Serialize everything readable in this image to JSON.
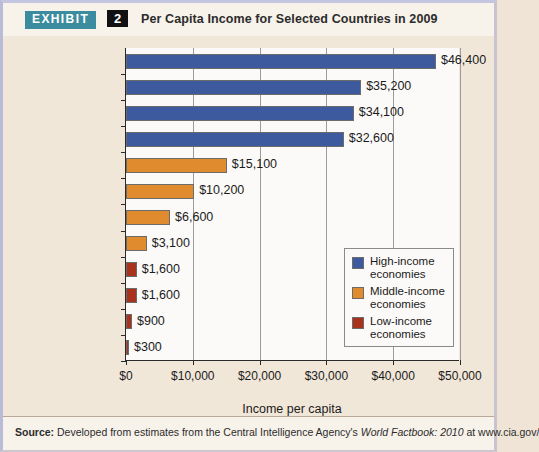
{
  "header": {
    "badge": "EXHIBIT",
    "number": "2",
    "title": "Per Capita Income for Selected Countries in 2009"
  },
  "footer": {
    "source_label": "Source:",
    "source_text_1": "Developed from estimates from the Central Intelligence Agency's",
    "source_italic": "World Factbook: 2010",
    "source_text_2": "at www.cia.gov/"
  },
  "legend": {
    "items": [
      {
        "label_line1": "High-income",
        "label_line2": "economies",
        "color": "#3d5a9e"
      },
      {
        "label_line1": "Middle-income",
        "label_line2": "economies",
        "color": "#e08b2e"
      },
      {
        "label_line1": "Low-income",
        "label_line2": "economies",
        "color": "#a8321c"
      }
    ]
  },
  "chart_data": {
    "type": "bar",
    "orientation": "horizontal",
    "title": "Per Capita Income for Selected Countries in 2009",
    "xlabel": "Income per capita",
    "ylabel": "",
    "xlim": [
      0,
      50000
    ],
    "xticks": [
      0,
      10000,
      20000,
      30000,
      40000,
      50000
    ],
    "xtick_labels": [
      "$0",
      "$10,000",
      "$20,000",
      "$30,000",
      "$40,000",
      "$50,000"
    ],
    "grid": true,
    "legend_position": "inside-right",
    "categories": [
      "United States",
      "United Kingdom",
      "Germany",
      "Japan",
      "Russia",
      "Brazil",
      "China",
      "India",
      "Bangladesh",
      "Kenya",
      "Ethiopia",
      "Congo"
    ],
    "values": [
      46400,
      35200,
      34100,
      32600,
      15100,
      10200,
      6600,
      3100,
      1600,
      1600,
      900,
      300
    ],
    "value_labels": [
      "$46,400",
      "$35,200",
      "$34,100",
      "$32,600",
      "$15,100",
      "$10,200",
      "$6,600",
      "$3,100",
      "$1,600",
      "$1,600",
      "$900",
      "$300"
    ],
    "groups": [
      "high",
      "high",
      "high",
      "high",
      "middle",
      "middle",
      "middle",
      "middle",
      "low",
      "low",
      "low",
      "low"
    ],
    "group_colors": {
      "high": "#3d5a9e",
      "middle": "#e08b2e",
      "low": "#a8321c"
    },
    "series": [
      {
        "name": "Per capita income (US$)",
        "values": [
          46400,
          35200,
          34100,
          32600,
          15100,
          10200,
          6600,
          3100,
          1600,
          1600,
          900,
          300
        ]
      }
    ]
  }
}
